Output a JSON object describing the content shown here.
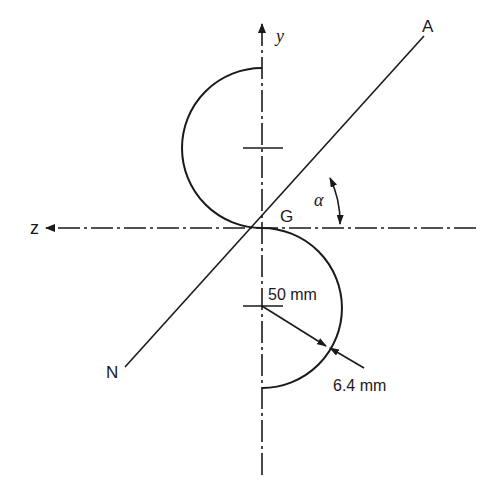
{
  "figure": {
    "axes": {
      "y_label": "y",
      "z_label": "z"
    },
    "points": {
      "centroid_label": "G",
      "end_upper_label": "A",
      "end_lower_label": "N"
    },
    "angle": {
      "symbol": "α"
    },
    "dimensions": {
      "radius": "50 mm",
      "thickness": "6.4 mm"
    },
    "colors": {
      "stroke": "#1a1a1a",
      "background": "#ffffff"
    }
  }
}
